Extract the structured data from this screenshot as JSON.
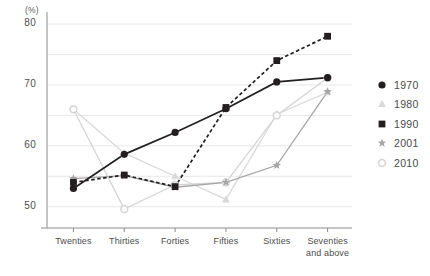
{
  "chart_data": {
    "type": "line",
    "title": "",
    "xlabel": "",
    "ylabel": "",
    "y_unit_label": "(%)",
    "categories": [
      "Twenties",
      "Thirties",
      "Forties",
      "Fifties",
      "Sixties",
      "Seventies\nand above"
    ],
    "categories_display": [
      "Twenties",
      "Thirties",
      "Forties",
      "Fifties",
      "Sixties",
      "Seventies and above"
    ],
    "yticks": [
      50,
      60,
      70,
      80
    ],
    "gridlines": [
      50,
      55,
      60,
      65,
      70,
      75,
      80
    ],
    "ylim": [
      46.5,
      81
    ],
    "grid": true,
    "legend_position": "right",
    "series": [
      {
        "name": "1970",
        "marker": "filled-circle",
        "color": "#231f20",
        "linestyle": "solid",
        "values": [
          53.0,
          58.6,
          62.2,
          66.1,
          70.5,
          71.2
        ]
      },
      {
        "name": "1980",
        "marker": "triangle",
        "color": "#d9d9d9",
        "linestyle": "solid",
        "values": [
          66.0,
          58.8,
          55.0,
          51.2,
          65.2,
          68.8
        ]
      },
      {
        "name": "1990",
        "marker": "filled-square",
        "color": "#231f20",
        "linestyle": "dashed",
        "values": [
          54.0,
          55.2,
          53.3,
          66.3,
          74.0,
          78.0
        ]
      },
      {
        "name": "2001",
        "marker": "star",
        "color": "#a6a6a6",
        "linestyle": "solid",
        "values": [
          54.6,
          55.1,
          53.2,
          54.0,
          56.8,
          68.9
        ]
      },
      {
        "name": "2010",
        "marker": "open-circle",
        "color": "#d4d4d4",
        "linestyle": "solid",
        "values": [
          66.0,
          49.6,
          53.6,
          54.0,
          65.0,
          71.2
        ]
      }
    ]
  },
  "legend": {
    "items": [
      {
        "label": "1970",
        "marker": "filled-circle"
      },
      {
        "label": "1980",
        "marker": "triangle"
      },
      {
        "label": "1990",
        "marker": "filled-square"
      },
      {
        "label": "2001",
        "marker": "star"
      },
      {
        "label": "2010",
        "marker": "open-circle"
      }
    ]
  },
  "axis": {
    "unit": "(%)"
  }
}
